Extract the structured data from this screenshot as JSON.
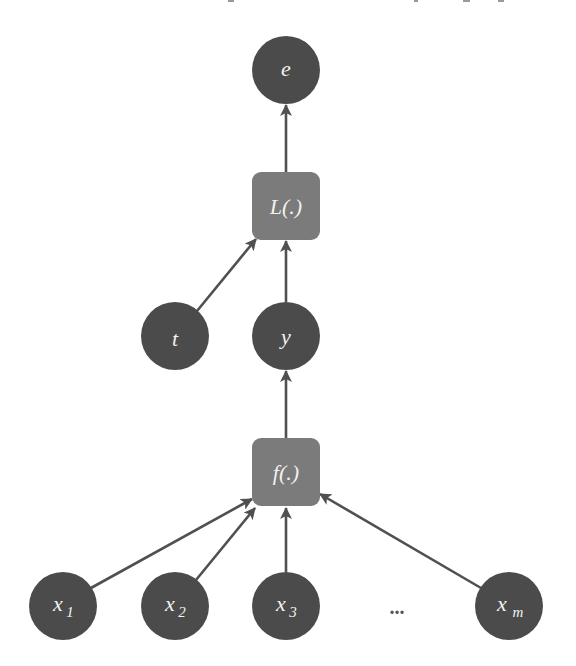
{
  "diagram": {
    "type": "computation-graph",
    "colors": {
      "variable_fill": "#4b4b4b",
      "function_fill": "#7b7b7b",
      "edge": "#505050",
      "label": "#f2f2f2",
      "background": "#ffffff"
    },
    "nodes": {
      "e": {
        "label": "e",
        "kind": "variable"
      },
      "L": {
        "label": "L(.)",
        "kind": "function"
      },
      "t": {
        "label": "t",
        "kind": "variable"
      },
      "y": {
        "label": "y",
        "kind": "variable"
      },
      "f": {
        "label": "f(.)",
        "kind": "function"
      },
      "x1": {
        "label": "x",
        "sub": "1",
        "kind": "variable"
      },
      "x2": {
        "label": "x",
        "sub": "2",
        "kind": "variable"
      },
      "x3": {
        "label": "x",
        "sub": "3",
        "kind": "variable"
      },
      "xm": {
        "label": "x",
        "sub": "m",
        "kind": "variable"
      }
    },
    "ellipsis": "...",
    "edges": [
      {
        "from": "x1",
        "to": "f"
      },
      {
        "from": "x2",
        "to": "f"
      },
      {
        "from": "x3",
        "to": "f"
      },
      {
        "from": "xm",
        "to": "f"
      },
      {
        "from": "f",
        "to": "y"
      },
      {
        "from": "y",
        "to": "L"
      },
      {
        "from": "t",
        "to": "L"
      },
      {
        "from": "L",
        "to": "e"
      }
    ]
  }
}
